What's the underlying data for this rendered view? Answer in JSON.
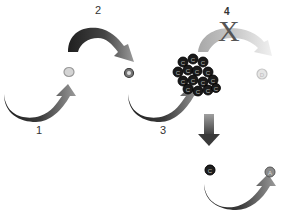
{
  "diagram": {
    "steps": [
      {
        "id": "1",
        "label": "1"
      },
      {
        "id": "2",
        "label": "2"
      },
      {
        "id": "3",
        "label": "3"
      },
      {
        "id": "4",
        "label": "4"
      }
    ],
    "blocked_marker": "X",
    "nodes": [
      {
        "name": "A",
        "glyph": "A",
        "fill": "#cfcfcf",
        "stroke": "#9a9a9a"
      },
      {
        "name": "B",
        "glyph": "B",
        "fill": "#6a6a6a",
        "stroke": "#3a3a3a"
      },
      {
        "name": "D",
        "glyph": "D",
        "fill": "#e2e2e2",
        "stroke": "#c4c4c4"
      },
      {
        "name": "C",
        "glyph": "C",
        "fill": "#1e1e1e",
        "stroke": "#000000"
      },
      {
        "name": "A-end",
        "glyph": "A",
        "fill": "#8a8a8a",
        "stroke": "#555555"
      }
    ],
    "cluster": {
      "name": "C-cluster",
      "glyph": "C",
      "count": 15
    },
    "colors": {
      "arrow_dark": "#2b2b2b",
      "arrow_mid": "#777777",
      "arrow_light": "#bdbdbd",
      "arrow_faded": "#e4e4e4"
    }
  }
}
